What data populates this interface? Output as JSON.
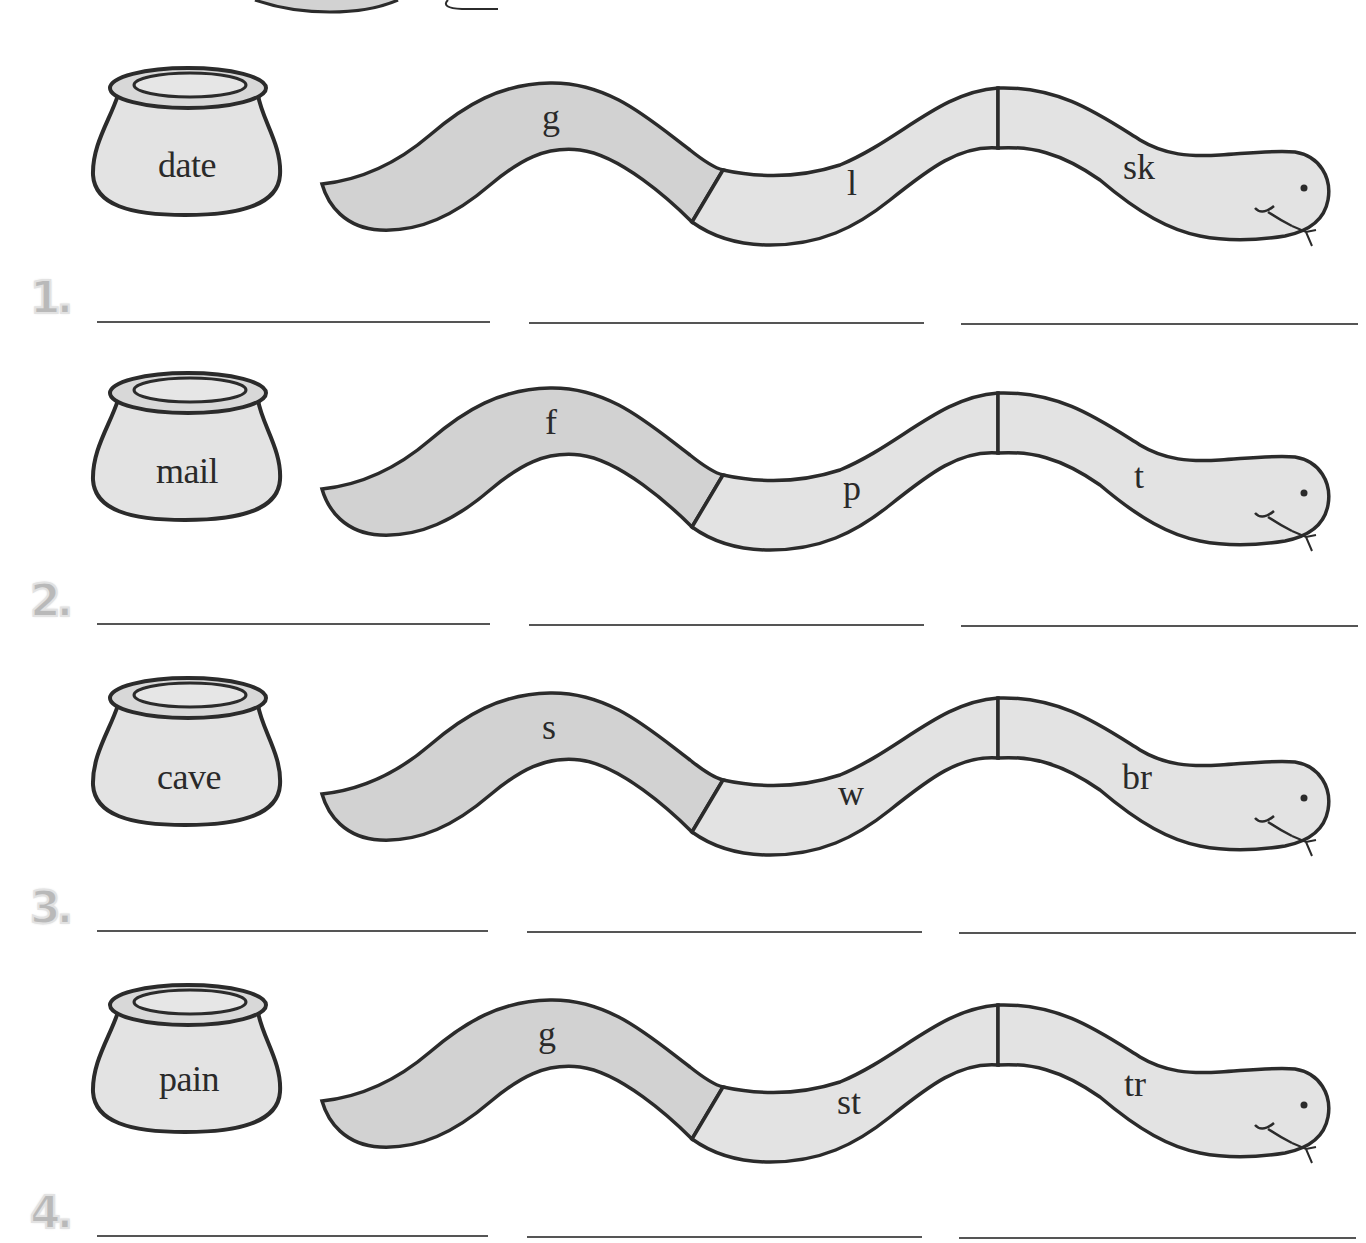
{
  "worksheet": {
    "colors": {
      "outline": "#2b2b2b",
      "fill_light": "#e3e3e3",
      "fill_dark": "#d2d2d2",
      "number": "#b9b9b9",
      "line": "#555555"
    },
    "rows": [
      {
        "number": "1.",
        "pot_word": "date",
        "segments": [
          "g",
          "l",
          "sk"
        ]
      },
      {
        "number": "2.",
        "pot_word": "mail",
        "segments": [
          "f",
          "p",
          "t"
        ]
      },
      {
        "number": "3.",
        "pot_word": "cave",
        "segments": [
          "s",
          "w",
          "br"
        ]
      },
      {
        "number": "4.",
        "pot_word": "pain",
        "segments": [
          "g",
          "st",
          "tr"
        ]
      }
    ],
    "answer_blanks_per_row": 3
  }
}
